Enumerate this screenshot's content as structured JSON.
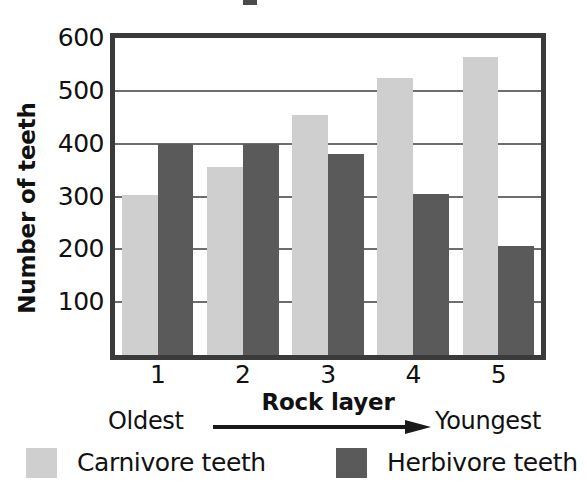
{
  "chart_data": {
    "type": "bar",
    "title": "",
    "xlabel": "Rock layer",
    "ylabel": "Number of teeth",
    "categories": [
      "1",
      "2",
      "3",
      "4",
      "5"
    ],
    "series": [
      {
        "name": "Carnivore teeth",
        "color": "#cfcfcf",
        "values": [
          303,
          355,
          455,
          525,
          565
        ]
      },
      {
        "name": "Herbivore teeth",
        "color": "#5a5a5a",
        "values": [
          400,
          400,
          380,
          305,
          207
        ]
      }
    ],
    "ylim": [
      0,
      600
    ],
    "yticks": [
      600,
      500,
      400,
      300,
      200,
      100
    ],
    "ytick_labels": [
      "600",
      "500",
      "400",
      "300",
      "200",
      "100"
    ],
    "grid": true,
    "legend_position": "bottom",
    "annotations": {
      "axis_direction_left": "Oldest",
      "axis_direction_right": "Youngest",
      "arrow": "right-arrow"
    }
  }
}
